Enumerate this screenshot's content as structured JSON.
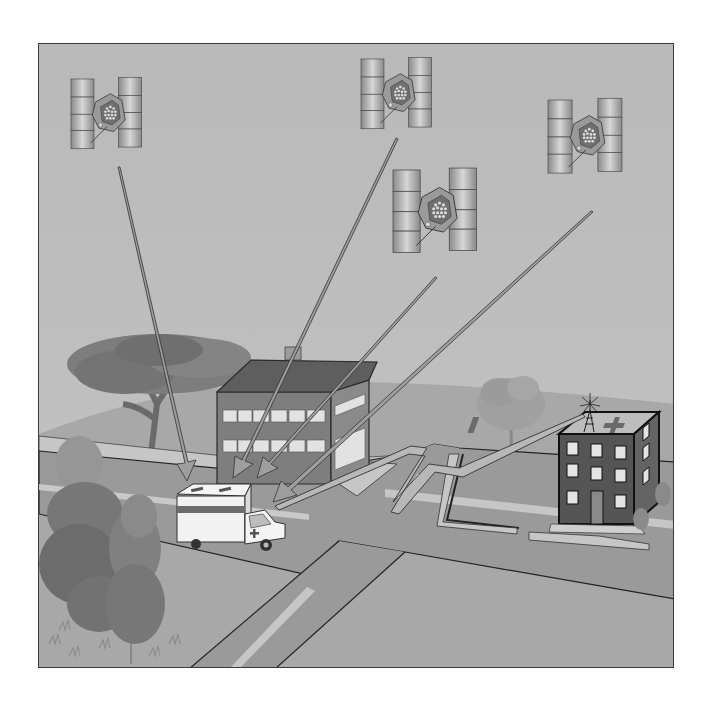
{
  "figure": {
    "kind": "illustration",
    "description": "GPS satellites transmitting signals to an ambulance, which relays its position by radio to a hospital rooftop antenna",
    "satellites": [
      {
        "id": "satellite-1"
      },
      {
        "id": "satellite-2"
      },
      {
        "id": "satellite-3"
      },
      {
        "id": "satellite-4"
      }
    ],
    "signal_arrows_count": 4,
    "ground_objects": [
      "ambulance",
      "office-building",
      "hospital",
      "radio-antenna",
      "trees",
      "roads",
      "sidewalks"
    ],
    "relay_link": "lightning-bolt radio signal from ambulance to hospital antenna"
  },
  "colors": {
    "page_background": "#ffffff",
    "sky": "#bdbdbd",
    "ground": "#a9a9a9",
    "road": "#9a9a9a",
    "sidewalk": "#c8c8c8",
    "building_wall": "#7a7a7a",
    "hospital_wall": "#555555",
    "arrow_fill": "#9e9e9e",
    "tree_dark": "#6e6e6e",
    "tree_light": "#959595",
    "frame_border": "#3a3a3a"
  }
}
